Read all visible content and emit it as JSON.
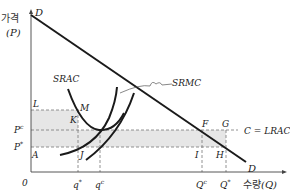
{
  "diagram": {
    "title": "",
    "y_axis": {
      "label_kor": "가격",
      "label_sym": "(P)"
    },
    "x_axis": {
      "label_kor": "수량",
      "label_sym": "(Q)"
    },
    "origin": "0",
    "curves": {
      "demand_top": "D",
      "demand_bottom": "D",
      "srac": "SRAC",
      "srmc": "SRMC",
      "lrac": "C = LRAC"
    },
    "points": {
      "L": "L",
      "M": "M",
      "K": "K",
      "A": "A",
      "J": "J",
      "F": "F",
      "G": "G",
      "I": "I",
      "H": "H"
    },
    "price_levels": {
      "pc": "P",
      "pc_sup": "c",
      "pstar": "P",
      "pstar_sup": "*"
    },
    "quantity_ticks": {
      "q_star": "q",
      "q_star_sup": "*",
      "q_c": "q",
      "q_c_sup": "c",
      "Q_c": "Q",
      "Q_c_sup": "c",
      "Q_star": "Q",
      "Q_star_sup": "*"
    },
    "colors": {
      "shade": "#e6e6e6",
      "line": "#1a1a1a",
      "dash": "#777777"
    }
  }
}
